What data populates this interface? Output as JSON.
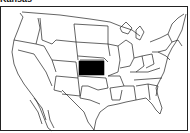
{
  "map": {
    "title": "Kansas",
    "highlighted_state": "Kansas",
    "region": "Contiguous United States",
    "highlight_color": "#000000",
    "outline_color": "#222222",
    "background_color": "#ffffff"
  }
}
